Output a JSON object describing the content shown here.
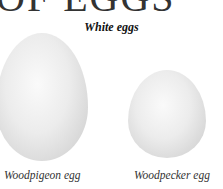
{
  "page": {
    "heading_partial": "OF EGGS",
    "section_title": "White eggs"
  },
  "eggs": [
    {
      "caption": "Woodpigeon egg",
      "color": "#ececec"
    },
    {
      "caption": "Woodpecker egg",
      "color": "#ececec"
    }
  ]
}
